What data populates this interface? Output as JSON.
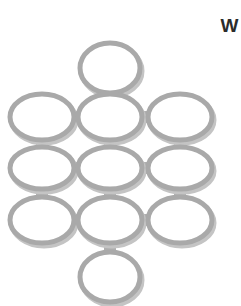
{
  "canvas": {
    "width": 241,
    "height": 306,
    "background_color": "#ffffff"
  },
  "corner_label": {
    "text": "W",
    "color": "#2b2b2b"
  },
  "style": {
    "ring_stroke_color": "#a9a9a9",
    "ring_shadow_color": "#c4c4c4",
    "ring_fill_color": "#ffffff",
    "ring_stroke_width": 5,
    "connector_color": "#b0b0b0",
    "connector_thickness": 11
  },
  "diagram": {
    "type": "ellipse-network",
    "node_count": 11,
    "connector_count": 14,
    "nodes": [
      {
        "id": "n-top",
        "label": "",
        "cx": 110,
        "cy": 68,
        "rx": 30,
        "ry": 25
      },
      {
        "id": "n-r2-left",
        "label": "",
        "cx": 42,
        "cy": 117,
        "rx": 32,
        "ry": 23
      },
      {
        "id": "n-r2-center",
        "label": "",
        "cx": 110,
        "cy": 117,
        "rx": 32,
        "ry": 23
      },
      {
        "id": "n-r2-right",
        "label": "",
        "cx": 180,
        "cy": 117,
        "rx": 32,
        "ry": 23
      },
      {
        "id": "n-r3-left",
        "label": "",
        "cx": 42,
        "cy": 168,
        "rx": 32,
        "ry": 21
      },
      {
        "id": "n-r3-center",
        "label": "",
        "cx": 110,
        "cy": 168,
        "rx": 32,
        "ry": 21
      },
      {
        "id": "n-r3-right",
        "label": "",
        "cx": 180,
        "cy": 168,
        "rx": 32,
        "ry": 21
      },
      {
        "id": "n-r4-left",
        "label": "",
        "cx": 42,
        "cy": 220,
        "rx": 32,
        "ry": 23
      },
      {
        "id": "n-r4-center",
        "label": "",
        "cx": 110,
        "cy": 220,
        "rx": 32,
        "ry": 23
      },
      {
        "id": "n-r4-right",
        "label": "",
        "cx": 180,
        "cy": 220,
        "rx": 32,
        "ry": 23
      },
      {
        "id": "n-bottom",
        "label": "",
        "cx": 110,
        "cy": 277,
        "rx": 30,
        "ry": 25
      }
    ],
    "connectors": [
      {
        "id": "c-top-r2c",
        "from": "n-top",
        "to": "n-r2-center",
        "orientation": "vertical",
        "x": 104,
        "y": 88,
        "w": 12,
        "h": 14
      },
      {
        "id": "c-r2l-r2c",
        "from": "n-r2-left",
        "to": "n-r2-center",
        "orientation": "horizontal",
        "x": 68,
        "y": 111,
        "w": 16,
        "h": 12
      },
      {
        "id": "c-r2c-r2r",
        "from": "n-r2-center",
        "to": "n-r2-right",
        "orientation": "horizontal",
        "x": 138,
        "y": 111,
        "w": 16,
        "h": 12
      },
      {
        "id": "c-r2l-r3l",
        "from": "n-r2-left",
        "to": "n-r3-left",
        "orientation": "vertical",
        "x": 36,
        "y": 137,
        "w": 12,
        "h": 13
      },
      {
        "id": "c-r2c-r3c",
        "from": "n-r2-center",
        "to": "n-r3-center",
        "orientation": "vertical",
        "x": 104,
        "y": 137,
        "w": 12,
        "h": 13
      },
      {
        "id": "c-r2r-r3r",
        "from": "n-r2-right",
        "to": "n-r3-right",
        "orientation": "vertical",
        "x": 174,
        "y": 137,
        "w": 12,
        "h": 13
      },
      {
        "id": "c-r3l-r3c",
        "from": "n-r3-left",
        "to": "n-r3-center",
        "orientation": "horizontal",
        "x": 68,
        "y": 162,
        "w": 16,
        "h": 12
      },
      {
        "id": "c-r3c-r3r",
        "from": "n-r3-center",
        "to": "n-r3-right",
        "orientation": "horizontal",
        "x": 138,
        "y": 162,
        "w": 16,
        "h": 12
      },
      {
        "id": "c-r3l-r4l",
        "from": "n-r3-left",
        "to": "n-r4-left",
        "orientation": "vertical",
        "x": 36,
        "y": 186,
        "w": 12,
        "h": 14
      },
      {
        "id": "c-r3c-r4c",
        "from": "n-r3-center",
        "to": "n-r4-center",
        "orientation": "vertical",
        "x": 104,
        "y": 186,
        "w": 12,
        "h": 14
      },
      {
        "id": "c-r3r-r4r",
        "from": "n-r3-right",
        "to": "n-r4-right",
        "orientation": "vertical",
        "x": 174,
        "y": 186,
        "w": 12,
        "h": 14
      },
      {
        "id": "c-r4l-r4c",
        "from": "n-r4-left",
        "to": "n-r4-center",
        "orientation": "horizontal",
        "x": 68,
        "y": 214,
        "w": 16,
        "h": 12
      },
      {
        "id": "c-r4c-r4r",
        "from": "n-r4-center",
        "to": "n-r4-right",
        "orientation": "horizontal",
        "x": 138,
        "y": 214,
        "w": 16,
        "h": 12
      },
      {
        "id": "c-r4c-bottom",
        "from": "n-r4-center",
        "to": "n-bottom",
        "orientation": "vertical",
        "x": 104,
        "y": 240,
        "w": 12,
        "h": 14
      }
    ]
  }
}
